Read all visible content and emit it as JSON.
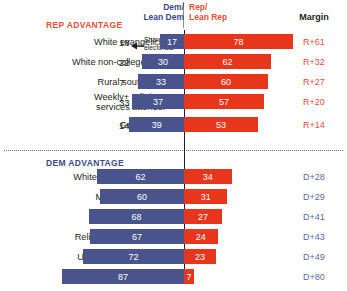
{
  "header": {
    "dem_label": "Dem/\nLean Dem",
    "rep_label": "Rep/\nLean Rep",
    "margin_label": "Margin"
  },
  "annotation": {
    "text": "Share of\nelectorate",
    "arrow_icon": "left-arrow-icon"
  },
  "sections": {
    "rep_title": "REP ADVANTAGE",
    "dem_title": "DEM ADVANTAGE"
  },
  "chart_data": {
    "type": "bar",
    "orientation": "horizontal-diverging",
    "title": "",
    "xlabel": "",
    "ylabel": "",
    "series": [
      {
        "name": "Dem/Lean Dem",
        "color": "#49548c"
      },
      {
        "name": "Rep/Lean Rep",
        "color": "#e8361c"
      }
    ],
    "axis_zero_line": true,
    "grid": false,
    "legend_position": "top",
    "columns": [
      "Group",
      "Share of electorate",
      "Dem/Lean Dem",
      "Rep/Lean Rep",
      "Margin"
    ],
    "groups": [
      {
        "section": "REP ADVANTAGE",
        "rows": [
          {
            "label": "White evangelical",
            "share": "18",
            "dem": 17,
            "rep": 78,
            "margin": "R+61",
            "lean": "rep"
          },
          {
            "label": "White non-college men",
            "share": "22",
            "dem": 30,
            "rep": 62,
            "margin": "R+32",
            "lean": "rep"
          },
          {
            "label": "Rural southerner",
            "share": "7",
            "dem": 33,
            "rep": 60,
            "margin": "R+27",
            "lean": "rep"
          },
          {
            "label": "Weekly+ religious\nservices attender",
            "share": "33",
            "dem": 37,
            "rep": 57,
            "margin": "R+20",
            "lean": "rep"
          },
          {
            "label": "Gen X men",
            "share": "14",
            "dem": 39,
            "rep": 53,
            "margin": "R+14",
            "lean": "rep"
          }
        ]
      },
      {
        "section": "DEM ADVANTAGE",
        "rows": [
          {
            "label": "White  college+ women",
            "share": "13",
            "dem": 62,
            "rep": 34,
            "margin": "D+28",
            "lean": "dem"
          },
          {
            "label": "Millennial women",
            "share": "11",
            "dem": 60,
            "rep": 31,
            "margin": "D+29",
            "lean": "dem"
          },
          {
            "label": "Hispanic Catholic",
            "share": "5",
            "dem": 68,
            "rep": 27,
            "margin": "D+41",
            "lean": "dem"
          },
          {
            "label": "Religiously unaffiliated",
            "share": "25",
            "dem": 67,
            "rep": 24,
            "margin": "D+43",
            "lean": "dem"
          },
          {
            "label": "Urban Northeasterner",
            "share": "6",
            "dem": 72,
            "rep": 23,
            "margin": "D+49",
            "lean": "dem"
          },
          {
            "label": "Black women",
            "share": "7",
            "dem": 87,
            "rep": 7,
            "margin": "D+80",
            "lean": "dem"
          }
        ]
      }
    ]
  },
  "colors": {
    "dem": "#49548c",
    "rep": "#e8361c",
    "dem_text": "#3b4a8c",
    "rep_text": "#e8503a",
    "margin_dem": "#5d6aa8",
    "margin_rep": "#e8503a",
    "axis": "#1b1b3a"
  }
}
